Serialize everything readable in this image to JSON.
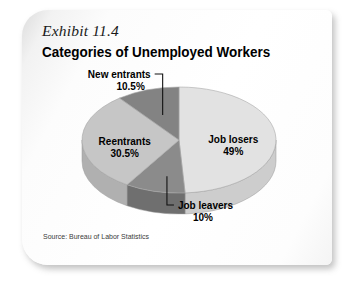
{
  "card": {
    "exhibit_label": "Exhibit 11.4",
    "title": "Categories of Unemployed Workers",
    "source": "Source: Bureau of Labor Statistics"
  },
  "chart_data": {
    "type": "pie",
    "title": "Categories of Unemployed Workers",
    "subtitle": "Exhibit 11.4",
    "source": "Source: Bureau of Labor Statistics",
    "three_d": true,
    "start_angle_deg": -90,
    "direction": "clockwise",
    "legend_position": "none",
    "grid": false,
    "categories": [
      "Job losers",
      "Job leavers",
      "Reentrants",
      "New entrants"
    ],
    "values": [
      49,
      10,
      30.5,
      10.5
    ],
    "unit": "percent",
    "total": 100,
    "slices": [
      {
        "label": "Job losers",
        "value_label": "49%",
        "value": 49,
        "color": "#e2e2e2",
        "side_color": "#cdcdcd",
        "label_placement": "inside"
      },
      {
        "label": "Job leavers",
        "value_label": "10%",
        "value": 10,
        "color": "#8b8b8b",
        "side_color": "#6f6f6f",
        "label_placement": "callout-below"
      },
      {
        "label": "Reentrants",
        "value_label": "30.5%",
        "value": 30.5,
        "color": "#c6c6c6",
        "side_color": "#b0b0b0",
        "label_placement": "inside"
      },
      {
        "label": "New entrants",
        "value_label": "10.5%",
        "value": 10.5,
        "color": "#838383",
        "side_color": "#6b6b6b",
        "label_placement": "callout-above"
      }
    ]
  }
}
